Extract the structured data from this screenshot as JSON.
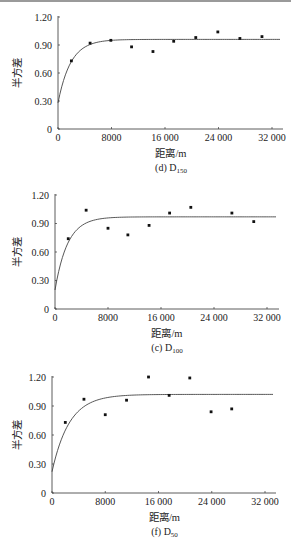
{
  "chart_data": [
    {
      "type": "scatter",
      "caption_prefix": "(d) D",
      "caption_sub": "150",
      "title": "(d) D150",
      "xlabel": "距离/m",
      "ylabel": "半方差",
      "xlim": [
        0,
        34000
      ],
      "ylim": [
        0,
        1.2
      ],
      "xticks": [
        0,
        8000,
        16000,
        24000,
        32000
      ],
      "xtick_labels": [
        "0",
        "8000",
        "16 000",
        "24 000",
        "32 000"
      ],
      "yticks": [
        0,
        0.3,
        0.6,
        0.9,
        1.2
      ],
      "ytick_labels": [
        "0",
        "0.30",
        "0.60",
        "0.90",
        "1.20"
      ],
      "grid": false,
      "series": [
        {
          "name": "experimental semivariance",
          "x": [
            2000,
            4800,
            7900,
            11000,
            14200,
            17300,
            20600,
            23900,
            27200,
            30500
          ],
          "y": [
            0.73,
            0.92,
            0.95,
            0.88,
            0.83,
            0.94,
            0.98,
            1.04,
            0.97,
            0.99
          ]
        },
        {
          "name": "fitted model",
          "model": "exponential",
          "nugget": 0.28,
          "sill": 0.96,
          "range_param": 1900
        }
      ]
    },
    {
      "type": "scatter",
      "caption_prefix": "(c) D",
      "caption_sub": "100",
      "title": "(c) D100",
      "xlabel": "距离/m",
      "ylabel": "半方差",
      "xlim": [
        0,
        34000
      ],
      "ylim": [
        0,
        1.2
      ],
      "xticks": [
        0,
        8000,
        16000,
        24000,
        32000
      ],
      "xtick_labels": [
        "0",
        "8000",
        "16 000",
        "24 000",
        "32 000"
      ],
      "yticks": [
        0,
        0.3,
        0.6,
        0.9,
        1.2
      ],
      "ytick_labels": [
        "0",
        "0.30",
        "0.60",
        "0.90",
        "1.20"
      ],
      "grid": false,
      "series": [
        {
          "name": "experimental semivariance",
          "x": [
            2000,
            4700,
            8000,
            11000,
            14200,
            17300,
            20500,
            26700,
            30000
          ],
          "y": [
            0.74,
            1.04,
            0.85,
            0.78,
            0.88,
            1.01,
            1.07,
            1.01,
            0.92
          ]
        },
        {
          "name": "fitted model",
          "model": "exponential",
          "nugget": 0.2,
          "sill": 0.97,
          "range_param": 1900
        }
      ]
    },
    {
      "type": "scatter",
      "caption_prefix": "(f) D",
      "caption_sub": "50",
      "title": "(f) D50",
      "xlabel": "距离/m",
      "ylabel": "半方差",
      "xlim": [
        0,
        34000
      ],
      "ylim": [
        0,
        1.2
      ],
      "xticks": [
        0,
        8000,
        16000,
        24000,
        32000
      ],
      "xtick_labels": [
        "0",
        "8000",
        "16 000",
        "24 000",
        "32 000"
      ],
      "yticks": [
        0,
        0.3,
        0.6,
        0.9,
        1.2
      ],
      "ytick_labels": [
        "0",
        "0.30",
        "0.60",
        "0.90",
        "1.20"
      ],
      "grid": false,
      "series": [
        {
          "name": "experimental semivariance",
          "x": [
            2000,
            4800,
            8000,
            11200,
            14500,
            17600,
            20700,
            23900,
            27000
          ],
          "y": [
            0.73,
            0.97,
            0.81,
            0.96,
            1.2,
            1.01,
            1.19,
            0.84,
            0.87
          ]
        },
        {
          "name": "fitted model",
          "model": "exponential",
          "nugget": 0.22,
          "sill": 1.02,
          "range_param": 2600
        }
      ]
    }
  ]
}
